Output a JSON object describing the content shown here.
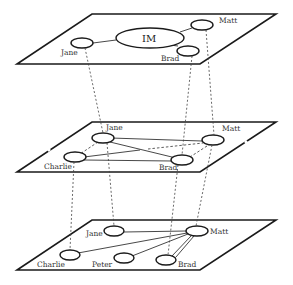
{
  "diagram": {
    "type": "multilayer-network",
    "layers": [
      {
        "id": "top",
        "center_label": "IM",
        "nodes": [
          {
            "name": "Jane",
            "label": "Jane"
          },
          {
            "name": "Matt",
            "label": "Matt"
          },
          {
            "name": "Brad",
            "label": "Brad"
          }
        ],
        "edges": [
          [
            "Jane",
            "IM"
          ],
          [
            "Matt",
            "IM"
          ],
          [
            "Brad",
            "IM"
          ]
        ]
      },
      {
        "id": "middle",
        "nodes": [
          {
            "name": "Jane",
            "label": "Jane"
          },
          {
            "name": "Matt",
            "label": "Matt"
          },
          {
            "name": "Charlie",
            "label": "Charlie"
          },
          {
            "name": "Brad",
            "label": "Brad"
          }
        ],
        "edges": [
          [
            "Jane",
            "Matt"
          ],
          [
            "Jane",
            "Brad"
          ],
          [
            "Charlie",
            "Brad"
          ],
          [
            "Charlie",
            "Matt"
          ]
        ],
        "dashed_edges": [
          [
            "Jane",
            "Charlie"
          ],
          [
            "Matt",
            "Brad"
          ]
        ]
      },
      {
        "id": "bottom",
        "nodes": [
          {
            "name": "Jane",
            "label": "Jane"
          },
          {
            "name": "Matt",
            "label": "Matt"
          },
          {
            "name": "Charlie",
            "label": "Charlie"
          },
          {
            "name": "Peter",
            "label": "Peter"
          },
          {
            "name": "Brad",
            "label": "Brad"
          }
        ],
        "edges": [
          [
            "Jane",
            "Matt"
          ],
          [
            "Charlie",
            "Matt"
          ],
          [
            "Peter",
            "Matt"
          ],
          [
            "Brad",
            "Matt"
          ]
        ]
      }
    ],
    "interlayer_links": [
      {
        "from": "top.Jane",
        "to": "middle.Jane"
      },
      {
        "from": "top.Brad",
        "to": "middle.Brad"
      },
      {
        "from": "top.Matt",
        "to": "middle.Matt"
      },
      {
        "from": "middle.Charlie",
        "to": "bottom.Charlie"
      },
      {
        "from": "middle.Jane",
        "to": "bottom.Jane"
      },
      {
        "from": "middle.Brad",
        "to": "bottom.Brad"
      },
      {
        "from": "middle.Matt",
        "to": "bottom.Matt"
      }
    ]
  },
  "labels": {
    "top": {
      "im": "IM",
      "jane": "Jane",
      "matt": "Matt",
      "brad": "Brad"
    },
    "middle": {
      "jane": "Jane",
      "matt": "Matt",
      "charlie": "Charlie",
      "brad": "Brad"
    },
    "bottom": {
      "jane": "Jane",
      "matt": "Matt",
      "charlie": "Charlie",
      "peter": "Peter",
      "brad": "Brad"
    }
  }
}
